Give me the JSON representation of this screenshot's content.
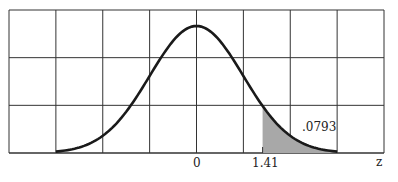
{
  "chart_data": {
    "type": "area",
    "title": "",
    "xlabel": "z",
    "ylabel": "",
    "xlim": [
      -4.2,
      3.9
    ],
    "grid": true,
    "grid_columns": 8,
    "grid_rows": 3,
    "tick_labels": [
      {
        "value": 0,
        "label": "0"
      },
      {
        "value": 1.41,
        "label": "1.41"
      }
    ],
    "shaded_region": {
      "from": 1.41,
      "to": 3.0,
      "area": 0.0793,
      "label": ".0793"
    },
    "curve": {
      "distribution": "standard normal",
      "mean": 0,
      "sd": 1,
      "range": [
        -3,
        3
      ]
    }
  },
  "labels": {
    "axis_z": "z",
    "tick_zero": "0",
    "tick_141": "1.41",
    "area": ".0793"
  },
  "colors": {
    "grid": "#333333",
    "curve": "#1a1a1a",
    "shade": "#a8a8a8"
  }
}
